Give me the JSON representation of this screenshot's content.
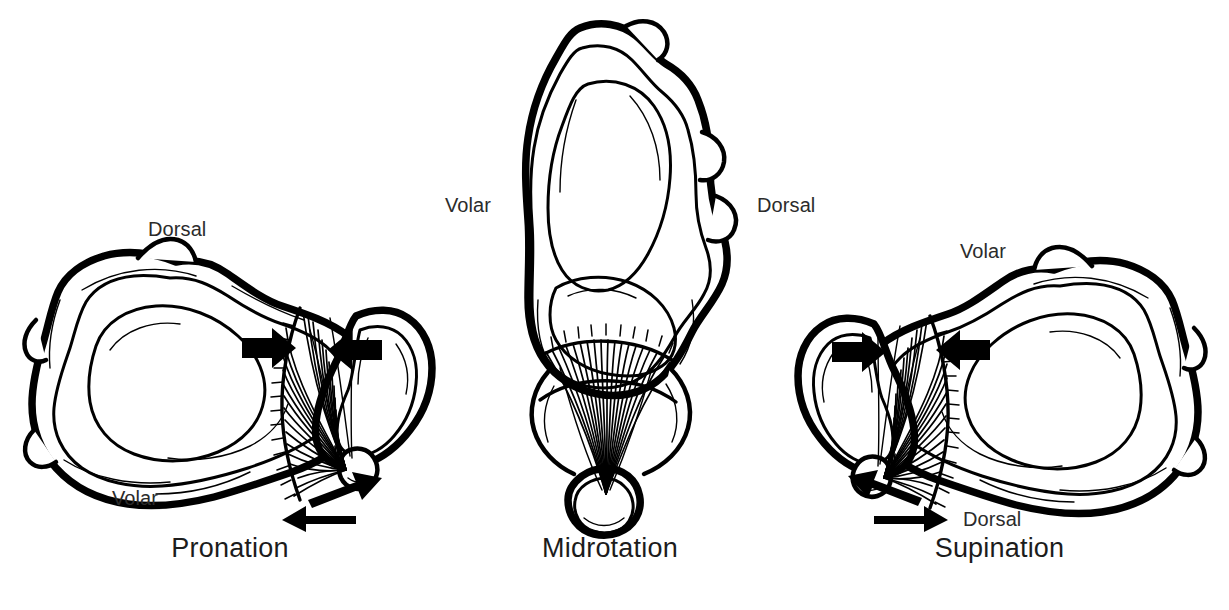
{
  "figure": {
    "background_color": "#ffffff",
    "ink_color": "#000000",
    "label_color": "#2b2b2b",
    "caption_color": "#1c1c1c"
  },
  "panels": [
    {
      "id": "pronation",
      "caption": "Pronation",
      "labels": {
        "top": "Dorsal",
        "bottom": "Volar"
      }
    },
    {
      "id": "midrotation",
      "caption": "Midrotation",
      "labels": {
        "left": "Volar",
        "right": "Dorsal"
      }
    },
    {
      "id": "supination",
      "caption": "Supination",
      "labels": {
        "top": "Volar",
        "bottom": "Dorsal"
      }
    }
  ],
  "annotations": {
    "compression_arrow": "block-arrow",
    "translation_arrow": "shear-arrow"
  },
  "bottom_caption": ""
}
